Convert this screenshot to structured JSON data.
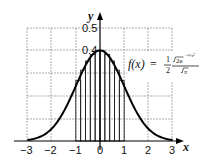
{
  "chart_data": {
    "type": "line",
    "title": "",
    "xlabel": "x",
    "ylabel": "y",
    "xlim": [
      -3,
      3
    ],
    "ylim": [
      0,
      0.5
    ],
    "grid": true,
    "x_ticks": [
      "-3",
      "-2",
      "-1",
      "0",
      "1",
      "2",
      "3"
    ],
    "y_ticks": [
      "0.4",
      "0.5"
    ],
    "series": [
      {
        "name": "f(x)",
        "function": "standard normal density",
        "x": [
          -3,
          -2.5,
          -2,
          -1.5,
          -1,
          -0.5,
          0,
          0.5,
          1,
          1.5,
          2,
          2.5,
          3
        ],
        "values": [
          0.004,
          0.018,
          0.054,
          0.13,
          0.242,
          0.352,
          0.399,
          0.352,
          0.242,
          0.13,
          0.054,
          0.018,
          0.004
        ]
      }
    ],
    "riemann_rectangles": {
      "from": -1,
      "to": 1,
      "count": 10,
      "width": 0.2
    },
    "annotations": [
      {
        "text": "f(x) = (1/2) · √(2e^(−½x²)) / √π",
        "position": "upper right"
      }
    ]
  },
  "labels": {
    "x_axis": "x",
    "y_axis": "y",
    "x_ticks": [
      "−3",
      "−2",
      "−1",
      "0",
      "1",
      "2",
      "3"
    ],
    "y_tick_04": "0.4",
    "y_tick_05": "0.5",
    "formula_lhs": "f(x)",
    "formula_eq": "=",
    "formula_num": "1",
    "formula_den": "2",
    "formula_sqrt_top": "2e",
    "formula_exp": "−½x²",
    "formula_sqrt_bottom": "π"
  }
}
